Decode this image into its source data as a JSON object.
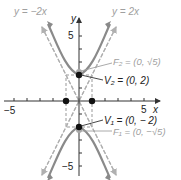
{
  "figure": {
    "asymptote_left_label": "y = −2x",
    "asymptote_right_label": "y = 2x",
    "x_axis_label": "x",
    "y_axis_label": "y",
    "x_tick_neg5": "−5",
    "x_tick_5": "5",
    "y_tick_5": "5",
    "y_tick_neg5": "−5",
    "focus_top_label": "F₂ = (0, √5)",
    "vertex_top_label": "V₂ = (0, 2)",
    "vertex_bottom_label": "V₁ = (0, − 2)",
    "focus_bottom_label": "F₁ = (0, −√5)"
  },
  "colors": {
    "curve": "#8a8a8a",
    "asymptote": "#b0b0b0",
    "axis": "#333333",
    "label_dark": "#222222",
    "label_light": "#a0a0a0"
  }
}
